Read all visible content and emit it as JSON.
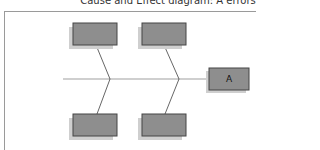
{
  "title": "Cause and Effect diagram: A errors",
  "diagram": {
    "type": "fishbone",
    "effect": {
      "label": "A",
      "x": 209,
      "y": 68,
      "w": 40,
      "h": 22
    },
    "spine": {
      "x1": 63,
      "y1": 79,
      "x2": 209,
      "y2": 79
    },
    "causes": [
      {
        "label": "",
        "x": 73,
        "y": 23,
        "w": 44,
        "h": 22,
        "bone": {
          "x1": 96,
          "y1": 45,
          "x2": 110,
          "y2": 79
        }
      },
      {
        "label": "",
        "x": 142,
        "y": 23,
        "w": 44,
        "h": 22,
        "bone": {
          "x1": 164,
          "y1": 45,
          "x2": 179,
          "y2": 79
        }
      },
      {
        "label": "",
        "x": 73,
        "y": 114,
        "w": 44,
        "h": 22,
        "bone": {
          "x1": 97,
          "y1": 114,
          "x2": 110,
          "y2": 79
        }
      },
      {
        "label": "",
        "x": 142,
        "y": 114,
        "w": 44,
        "h": 22,
        "bone": {
          "x1": 165,
          "y1": 114,
          "x2": 179,
          "y2": 79
        }
      }
    ],
    "colors": {
      "box_fill": "#8e8e8e",
      "box_border": "#444444",
      "box_shadow": "#cfcfcf",
      "spine": "#a0a0a0",
      "bone": "#555555",
      "frame": "#9a9a9a"
    }
  }
}
